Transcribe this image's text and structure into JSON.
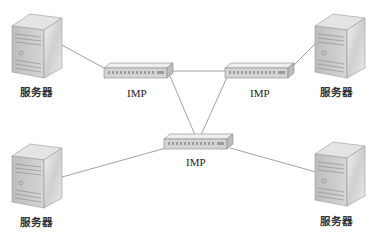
{
  "diagram": {
    "type": "network-topology",
    "colors": {
      "line": "#8a8a8a",
      "server_front": "#c9c9c9",
      "server_side": "#e6e6e6",
      "switch_body": "#d8d8d8",
      "text": "#222222"
    },
    "nodes": [
      {
        "id": "server-top-left",
        "kind": "server",
        "label": "服务器"
      },
      {
        "id": "server-top-right",
        "kind": "server",
        "label": "服务器"
      },
      {
        "id": "server-bottom-left",
        "kind": "server",
        "label": "服务器"
      },
      {
        "id": "server-bottom-right",
        "kind": "server",
        "label": "服务器"
      },
      {
        "id": "imp-top-left",
        "kind": "switch",
        "label": "IMP"
      },
      {
        "id": "imp-top-right",
        "kind": "switch",
        "label": "IMP"
      },
      {
        "id": "imp-center",
        "kind": "switch",
        "label": "IMP"
      }
    ],
    "edges": [
      {
        "from": "server-top-left",
        "to": "imp-top-left"
      },
      {
        "from": "imp-top-left",
        "to": "imp-top-right"
      },
      {
        "from": "imp-top-left",
        "to": "imp-center"
      },
      {
        "from": "imp-top-right",
        "to": "imp-center"
      },
      {
        "from": "imp-top-right",
        "to": "server-top-right"
      },
      {
        "from": "server-bottom-left",
        "to": "imp-center"
      },
      {
        "from": "imp-center",
        "to": "server-bottom-right"
      }
    ]
  }
}
